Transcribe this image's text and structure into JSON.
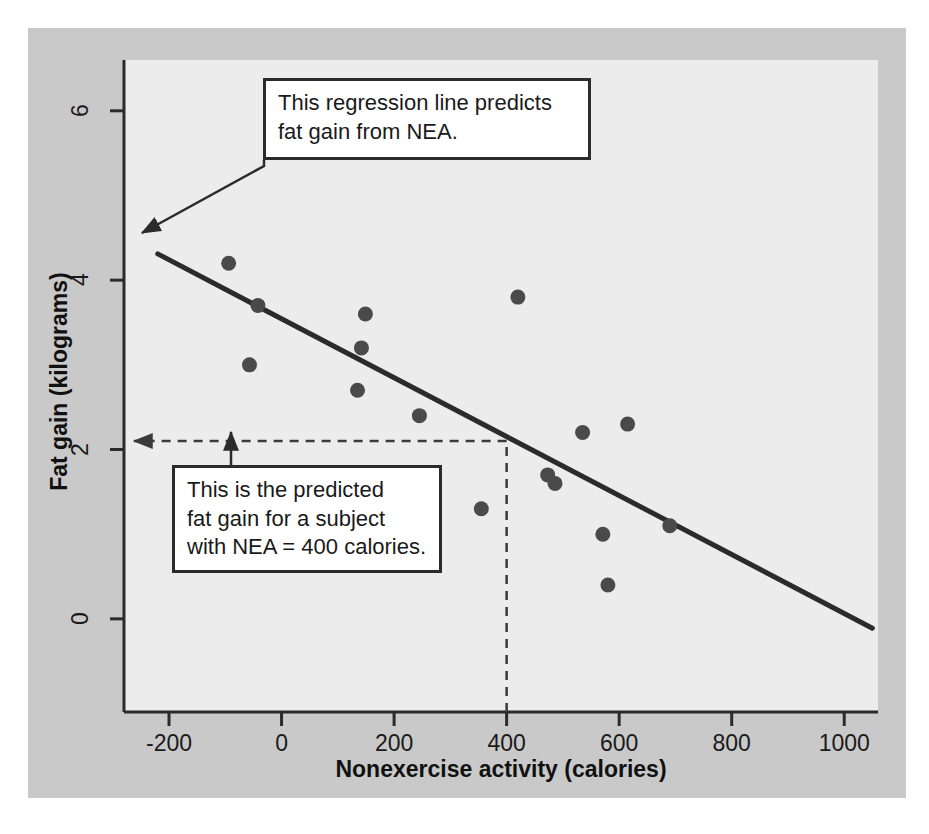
{
  "figure": {
    "background_color": "#ffffff",
    "mat_color": "#c9c9c9",
    "panel_color": "#ececec",
    "ink_color": "#2b2b2b"
  },
  "annotations": {
    "regression_callout": "This regression line predicts\nfat gain from NEA.",
    "predicted_callout": "This is the predicted\nfat gain for a subject\nwith NEA = 400 calories."
  },
  "chart_data": {
    "type": "scatter",
    "title": "",
    "xlabel": "Nonexercise activity (calories)",
    "ylabel": "Fat gain (kilograms)",
    "xlim": [
      -280,
      1060
    ],
    "ylim": [
      -1.1,
      6.6
    ],
    "xticks": [
      -200,
      0,
      200,
      400,
      600,
      800,
      1000
    ],
    "xtick_labels": [
      "-200",
      "0",
      "200",
      "400",
      "600",
      "800",
      "1000"
    ],
    "yticks": [
      0,
      2,
      4,
      6
    ],
    "ytick_labels": [
      "0",
      "2",
      "4",
      "6"
    ],
    "grid": false,
    "legend": "none",
    "marker_color": "#4a4a4a",
    "points": [
      {
        "x": -94,
        "y": 4.2
      },
      {
        "x": -57,
        "y": 3.0
      },
      {
        "x": -42,
        "y": 3.7
      },
      {
        "x": 135,
        "y": 2.7
      },
      {
        "x": 142,
        "y": 3.2
      },
      {
        "x": 149,
        "y": 3.6
      },
      {
        "x": 245,
        "y": 2.4
      },
      {
        "x": 355,
        "y": 1.3
      },
      {
        "x": 420,
        "y": 3.8
      },
      {
        "x": 473,
        "y": 1.7
      },
      {
        "x": 486,
        "y": 1.6
      },
      {
        "x": 535,
        "y": 2.2
      },
      {
        "x": 571,
        "y": 1.0
      },
      {
        "x": 580,
        "y": 0.4
      },
      {
        "x": 615,
        "y": 2.3
      },
      {
        "x": 690,
        "y": 1.1
      }
    ],
    "regression_line": {
      "label": "regression line",
      "color": "#2b2b2b",
      "slope": -0.00345,
      "intercept": 3.51,
      "x_start": -220,
      "y_start": 4.31,
      "x_end": 1050,
      "y_end": -0.11
    },
    "prediction_guide": {
      "style": "dashed",
      "x_value": 400,
      "y_value": 2.1,
      "color": "#3a3a3a"
    }
  }
}
